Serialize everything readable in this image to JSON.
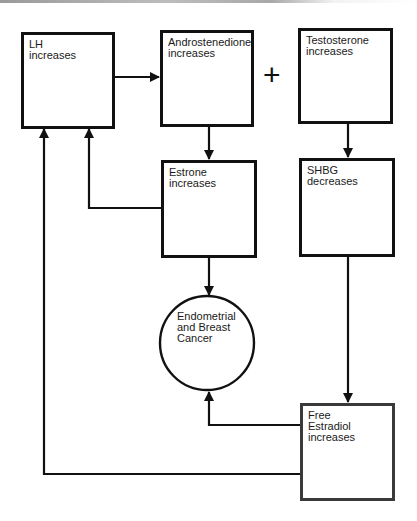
{
  "diagram": {
    "type": "flowchart",
    "nodes": {
      "lh": {
        "label": "LH\nincreases"
      },
      "androstenedione": {
        "label": "Androstenedione\nincreases"
      },
      "testosterone": {
        "label": "Testosterone\nincreases"
      },
      "estrone": {
        "label": "Estrone\nincreases"
      },
      "shbg": {
        "label": "SHBG\ndecreases"
      },
      "cancer": {
        "label": "Endometrial\nand Breast\nCancer"
      },
      "free_estradiol": {
        "label": "Free\nEstradiol\nincreases"
      }
    },
    "operator": "+",
    "edges": [
      {
        "from": "LH increases",
        "to": "Androstenedione increases"
      },
      {
        "from": "Androstenedione increases",
        "to": "Estrone increases"
      },
      {
        "from": "Estrone increases",
        "to": "LH increases"
      },
      {
        "from": "Estrone increases",
        "to": "Endometrial and Breast Cancer"
      },
      {
        "from": "Testosterone increases",
        "to": "SHBG decreases"
      },
      {
        "from": "SHBG decreases",
        "to": "Free Estradiol increases"
      },
      {
        "from": "Free Estradiol increases",
        "to": "Endometrial and Breast Cancer"
      },
      {
        "from": "Free Estradiol increases",
        "to": "LH increases"
      }
    ],
    "colors": {
      "line": "#111111",
      "background": "#ffffff"
    }
  }
}
